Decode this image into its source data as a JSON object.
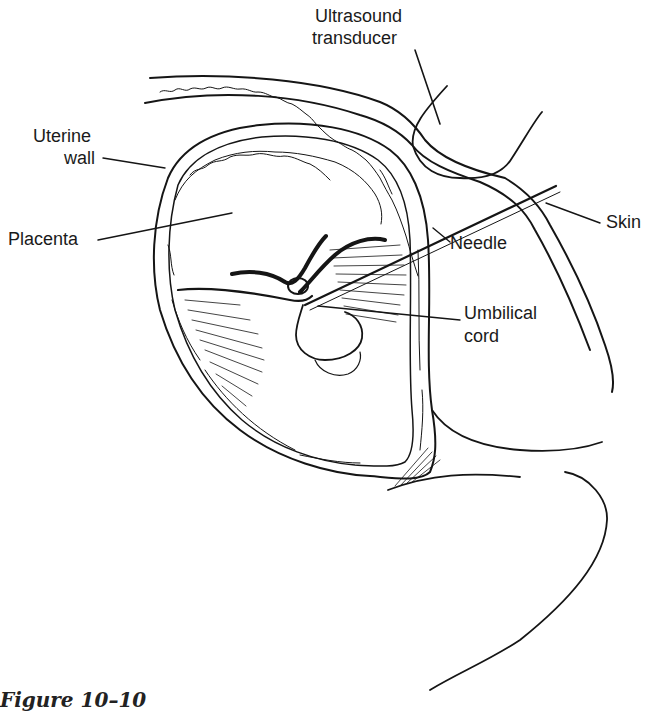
{
  "figure": {
    "caption": "Figure 10–10",
    "colors": {
      "ink": "#151515",
      "background": "#ffffff"
    }
  },
  "labels": {
    "ultrasound_transducer": {
      "line1": "Ultrasound",
      "line2": "transducer"
    },
    "uterine_wall": {
      "line1": "Uterine",
      "line2": "wall"
    },
    "placenta": "Placenta",
    "skin": "Skin",
    "needle": "Needle",
    "umbilical_cord": {
      "line1": "Umbilical",
      "line2": "cord"
    }
  }
}
